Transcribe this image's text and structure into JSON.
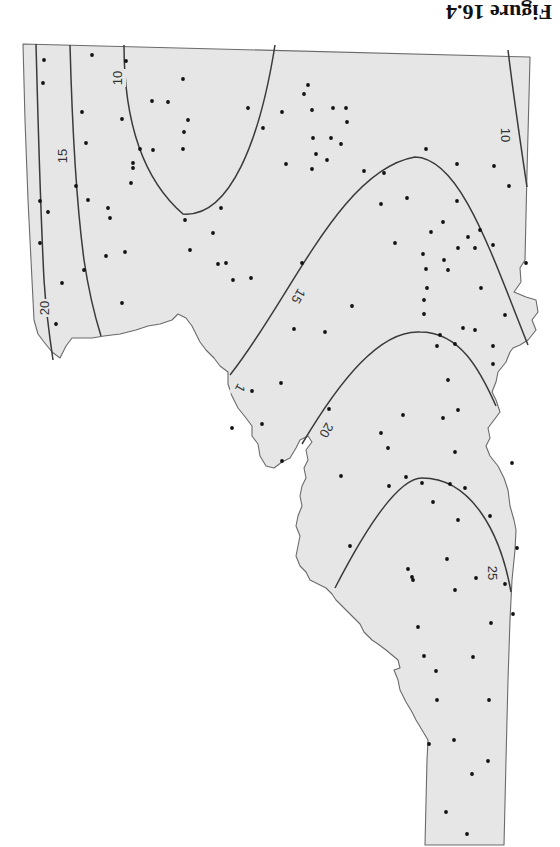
{
  "figure": {
    "caption": "Figure 16.4",
    "orientation": "rotated 180 degrees (printed upside-down)"
  },
  "map": {
    "description": "Contour (isoline) map over state outline with sample point locations",
    "colors": {
      "fill": "#e6e6e6",
      "outline": "#6a6a6a",
      "contour": "#3a3a3a",
      "points": "#111111"
    },
    "contour_labels": [
      {
        "id": "c20-left",
        "text": "20",
        "x": 45,
        "y": 308,
        "rotate": -90
      },
      {
        "id": "c15-left",
        "text": "15",
        "x": 63,
        "y": 156,
        "rotate": -90
      },
      {
        "id": "c10-ellipse",
        "text": "10",
        "x": 118,
        "y": 78,
        "rotate": -90
      },
      {
        "id": "c10-right",
        "text": "10",
        "x": 505,
        "y": 135,
        "rotate": 90
      },
      {
        "id": "c15-mid",
        "text": "15",
        "x": 298,
        "y": 296,
        "rotate": 120
      },
      {
        "id": "c1-fragment",
        "text": "1",
        "x": 240,
        "y": 388,
        "rotate": 120
      },
      {
        "id": "c20-mid",
        "text": "20",
        "x": 326,
        "y": 430,
        "rotate": 120
      },
      {
        "id": "c25-lower",
        "text": "25",
        "x": 492,
        "y": 573,
        "rotate": 90
      }
    ],
    "contour_values": [
      "10",
      "15",
      "20",
      "25"
    ]
  },
  "points": [
    [
      44,
      60
    ],
    [
      92,
      55
    ],
    [
      43,
      83
    ],
    [
      126,
      61
    ],
    [
      152,
      101
    ],
    [
      183,
      79
    ],
    [
      168,
      102
    ],
    [
      82,
      112
    ],
    [
      122,
      119
    ],
    [
      188,
      120
    ],
    [
      184,
      132
    ],
    [
      153,
      150
    ],
    [
      140,
      149
    ],
    [
      133,
      163
    ],
    [
      131,
      183
    ],
    [
      86,
      143
    ],
    [
      183,
      149
    ],
    [
      133,
      168
    ],
    [
      40,
      201
    ],
    [
      40,
      243
    ],
    [
      48,
      212
    ],
    [
      76,
      186
    ],
    [
      88,
      200
    ],
    [
      108,
      208
    ],
    [
      110,
      218
    ],
    [
      106,
      256
    ],
    [
      62,
      283
    ],
    [
      56,
      324
    ],
    [
      84,
      270
    ],
    [
      125,
      252
    ],
    [
      122,
      303
    ],
    [
      185,
      220
    ],
    [
      221,
      208
    ],
    [
      213,
      233
    ],
    [
      190,
      250
    ],
    [
      218,
      264
    ],
    [
      226,
      263
    ],
    [
      233,
      280
    ],
    [
      251,
      278
    ],
    [
      263,
      128
    ],
    [
      248,
      108
    ],
    [
      304,
      94
    ],
    [
      312,
      110
    ],
    [
      312,
      169
    ],
    [
      308,
      85
    ],
    [
      282,
      112
    ],
    [
      313,
      138
    ],
    [
      316,
      154
    ],
    [
      286,
      164
    ],
    [
      333,
      108
    ],
    [
      346,
      108
    ],
    [
      347,
      122
    ],
    [
      331,
      138
    ],
    [
      341,
      144
    ],
    [
      327,
      160
    ],
    [
      364,
      171
    ],
    [
      384,
      173
    ],
    [
      426,
      149
    ],
    [
      457,
      164
    ],
    [
      494,
      166
    ],
    [
      509,
      186
    ],
    [
      407,
      198
    ],
    [
      457,
      201
    ],
    [
      480,
      230
    ],
    [
      431,
      232
    ],
    [
      443,
      222
    ],
    [
      381,
      204
    ],
    [
      493,
      245
    ],
    [
      458,
      248
    ],
    [
      468,
      237
    ],
    [
      475,
      248
    ],
    [
      423,
      254
    ],
    [
      395,
      243
    ],
    [
      444,
      260
    ],
    [
      448,
      270
    ],
    [
      426,
      269
    ],
    [
      526,
      263
    ],
    [
      427,
      288
    ],
    [
      424,
      300
    ],
    [
      481,
      288
    ],
    [
      424,
      314
    ],
    [
      437,
      346
    ],
    [
      455,
      344
    ],
    [
      463,
      328
    ],
    [
      505,
      315
    ],
    [
      475,
      330
    ],
    [
      448,
      380
    ],
    [
      493,
      346
    ],
    [
      440,
      335
    ],
    [
      381,
      433
    ],
    [
      403,
      415
    ],
    [
      493,
      364
    ],
    [
      458,
      410
    ],
    [
      455,
      452
    ],
    [
      433,
      502
    ],
    [
      406,
      477
    ],
    [
      341,
      476
    ],
    [
      302,
      263
    ],
    [
      352,
      306
    ],
    [
      325,
      332
    ],
    [
      294,
      329
    ],
    [
      281,
      383
    ],
    [
      252,
      391
    ],
    [
      262,
      424
    ],
    [
      232,
      428
    ],
    [
      282,
      461
    ],
    [
      329,
      409
    ],
    [
      388,
      448
    ],
    [
      389,
      486
    ],
    [
      422,
      483
    ],
    [
      450,
      484
    ],
    [
      465,
      488
    ],
    [
      458,
      520
    ],
    [
      447,
      559
    ],
    [
      408,
      569
    ],
    [
      412,
      577
    ],
    [
      413,
      580
    ],
    [
      455,
      590
    ],
    [
      476,
      578
    ],
    [
      418,
      627
    ],
    [
      505,
      584
    ],
    [
      513,
      614
    ],
    [
      491,
      623
    ],
    [
      424,
      656
    ],
    [
      436,
      671
    ],
    [
      473,
      657
    ],
    [
      437,
      700
    ],
    [
      489,
      700
    ],
    [
      454,
      740
    ],
    [
      429,
      744
    ],
    [
      488,
      761
    ],
    [
      472,
      774
    ],
    [
      446,
      812
    ],
    [
      467,
      834
    ],
    [
      517,
      548
    ],
    [
      512,
      463
    ],
    [
      443,
      418
    ],
    [
      350,
      546
    ],
    [
      490,
      516
    ]
  ]
}
